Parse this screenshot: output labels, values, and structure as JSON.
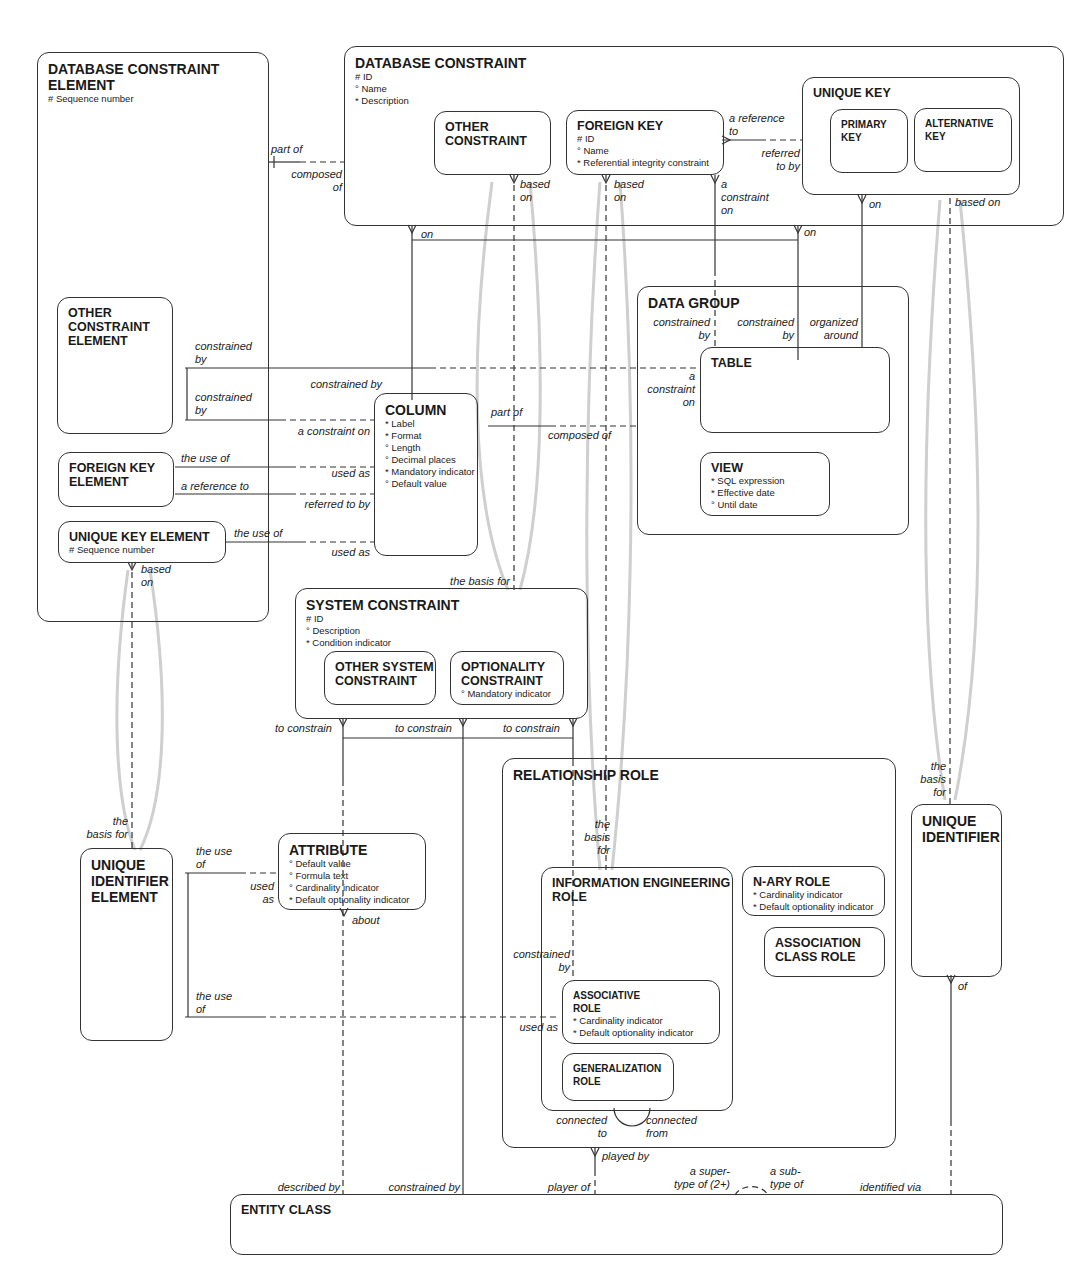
{
  "diagram": {
    "entities": {
      "database_constraint_element": {
        "title": "DATABASE CONSTRAINT\nELEMENT",
        "attrs": "# Sequence number"
      },
      "database_constraint": {
        "title": "DATABASE CONSTRAINT",
        "attrs": "# ID\n° Name\n* Description"
      },
      "other_constraint": {
        "title": "OTHER\nCONSTRAINT",
        "attrs": ""
      },
      "foreign_key": {
        "title": "FOREIGN KEY",
        "attrs": "# ID\n° Name\n* Referential integrity constraint"
      },
      "unique_key": {
        "title": "UNIQUE KEY",
        "attrs": ""
      },
      "primary_key": {
        "title": "PRIMARY\nKEY",
        "attrs": ""
      },
      "alternative_key": {
        "title": "ALTERNATIVE\nKEY",
        "attrs": ""
      },
      "other_constraint_element": {
        "title": "OTHER\nCONSTRAINT\nELEMENT",
        "attrs": ""
      },
      "foreign_key_element": {
        "title": "FOREIGN KEY\nELEMENT",
        "attrs": ""
      },
      "unique_key_element": {
        "title": "UNIQUE KEY ELEMENT",
        "attrs": "# Sequence number"
      },
      "column": {
        "title": "COLUMN",
        "attrs": "* Label\n* Format\n° Length\n° Decimal places\n* Mandatory indicator\n° Default value"
      },
      "data_group": {
        "title": "DATA GROUP",
        "attrs": ""
      },
      "table": {
        "title": "TABLE",
        "attrs": ""
      },
      "view": {
        "title": "VIEW",
        "attrs": "* SQL expression\n* Effective date\n° Until date"
      },
      "system_constraint": {
        "title": "SYSTEM CONSTRAINT",
        "attrs": "# ID\n° Description\n* Condition indicator"
      },
      "other_system_constraint": {
        "title": "OTHER SYSTEM\nCONSTRAINT",
        "attrs": ""
      },
      "optionality_constraint": {
        "title": "OPTIONALITY\nCONSTRAINT",
        "attrs": "° Mandatory indicator"
      },
      "unique_identifier_element": {
        "title": "UNIQUE\nIDENTIFIER\nELEMENT",
        "attrs": ""
      },
      "attribute": {
        "title": "ATTRIBUTE",
        "attrs": "° Default value\n° Formula text\n° Cardinality indicator\n* Default optionality indicator"
      },
      "relationship_role": {
        "title": "RELATIONSHIP ROLE",
        "attrs": ""
      },
      "information_engineering_role": {
        "title": "INFORMATION ENGINEERING\nROLE",
        "attrs": ""
      },
      "associative_role": {
        "title": "ASSOCIATIVE\nROLE",
        "attrs": "* Cardinality indicator\n* Default optionality indicator"
      },
      "generalization_role": {
        "title": "GENERALIZATION\nROLE",
        "attrs": ""
      },
      "n_ary_role": {
        "title": "N-ARY ROLE",
        "attrs": "* Cardinality indicator\n* Default optionality indicator"
      },
      "association_class_role": {
        "title": "ASSOCIATION\nCLASS ROLE",
        "attrs": ""
      },
      "unique_identifier": {
        "title": "UNIQUE\nIDENTIFIER",
        "attrs": ""
      },
      "entity_class": {
        "title": "ENTITY CLASS",
        "attrs": ""
      }
    },
    "labels": {
      "part_of_1": "part of",
      "composed_of_1": "composed\nof",
      "oc_based_on": "based\non",
      "fk_based_on": "based\non",
      "fk_constraint_on": "a\nconstraint\non",
      "fk_reference_to": "a reference\nto",
      "uk_referred_to_by": "referred\nto by",
      "uk_on": "on",
      "ak_based_on": "based on",
      "dc_on_left": "on",
      "dc_on_right": "on",
      "oce_constrained_by_1": "constrained\nby",
      "oce_constrained_by_2": "constrained\nby",
      "col_constrained_by": "constrained by",
      "col_constraint_on": "a constraint on",
      "fke_use_of": "the use of",
      "col_used_as_1": "used as",
      "fke_reference_to": "a reference to",
      "col_referred_to_by": "referred to by",
      "uke_use_of": "the use of",
      "col_used_as_2": "used as",
      "uke_based_on": "based\non",
      "col_part_of": "part of",
      "dg_composed_of": "composed of",
      "dg_constrained_by_1": "constrained\nby",
      "dg_constrained_by_2": "constrained\nby",
      "dg_organized_around": "organized\naround",
      "table_constraint_on": "a\nconstraint\non",
      "sc_basis_for": "the basis for",
      "to_constrain_1": "to constrain",
      "to_constrain_2": "to constrain",
      "to_constrain_3": "to constrain",
      "uie_basis_for": "the\nbasis for",
      "uie_use_of_1": "the use\nof",
      "attr_used_as": "used\nas",
      "attr_about": "about",
      "uie_use_of_2": "the use\nof",
      "ar_used_as": "used as",
      "ier_constrained_by": "constrained\nby",
      "ier_basis_for": "the\nbasis\nfor",
      "connected_to": "connected\nto",
      "connected_from": "connected\nfrom",
      "played_by": "played by",
      "ui_basis_for": "the\nbasis\nfor",
      "ui_of": "of",
      "described_by": "described by",
      "ec_constrained_by": "constrained by",
      "player_of": "player of",
      "supertype_of": "a super-\ntype of (2+)",
      "subtype_of": "a sub-\ntype of",
      "identified_via": "identified via"
    }
  }
}
